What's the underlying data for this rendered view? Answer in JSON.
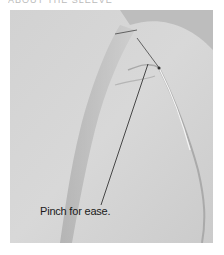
{
  "figure": {
    "header_text": "ABOUT THE SLEEVE",
    "caption": "Pinch for ease."
  }
}
